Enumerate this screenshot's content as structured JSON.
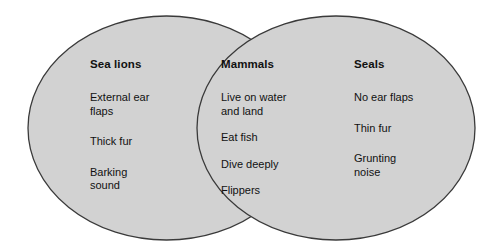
{
  "diagram": {
    "type": "venn",
    "set_count": 2,
    "colors": {
      "fill": "#d2d2d2",
      "stroke": "#3a3a3a",
      "text": "#111111",
      "background": "#ffffff"
    },
    "regions": [
      {
        "id": "sea-lions",
        "role": "left-only",
        "heading": "Sea lions",
        "items": [
          "External ear\nflaps",
          "Thick fur",
          "Barking\nsound"
        ]
      },
      {
        "id": "mammals",
        "role": "intersection",
        "heading": "Mammals",
        "items": [
          "Live on water\nand land",
          "Eat fish",
          "Dive deeply",
          "Flippers"
        ]
      },
      {
        "id": "seals",
        "role": "right-only",
        "heading": "Seals",
        "items": [
          "No ear flaps",
          "Thin fur",
          "Grunting\nnoise"
        ]
      }
    ]
  }
}
